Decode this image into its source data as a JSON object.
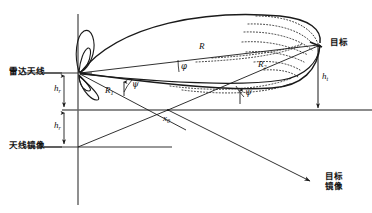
{
  "figure": {
    "type": "radar-multipath-geometry",
    "background_color": "#ffffff",
    "line_color": "#1a1a1a",
    "width": 372,
    "height": 213
  },
  "labels": {
    "radar_antenna": "雷达天线",
    "antenna_image": "天线镜像",
    "target": "目标",
    "target_image_line1": "目标",
    "target_image_line2": "镜像",
    "range_direct": "R",
    "range_r1_base": "R",
    "range_r1_sub": "1",
    "range_r2_base": "R",
    "range_r2_sub": "2",
    "angle_phi": "φ",
    "angle_psi_left": "ψ",
    "angle_psi_right": "ψ",
    "height_radar_upper_base": "h",
    "height_radar_upper_sub": "r",
    "height_radar_lower_base": "h",
    "height_radar_lower_sub": "r",
    "height_target_base": "h",
    "height_target_sub": "t",
    "reflection_point_base": "x",
    "reflection_point_sub": "0"
  },
  "geometry": {
    "antenna_apex_x": 78,
    "antenna_apex_y": 73,
    "target_x": 318,
    "target_y": 45,
    "reflection_point_x": 168,
    "reflection_point_y": 117,
    "ground_line_y": 100,
    "antenna_image_y": 146,
    "target_image_x": 312,
    "target_image_y": 182,
    "vertical_axis_x": 78
  }
}
